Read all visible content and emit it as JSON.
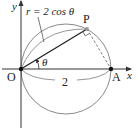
{
  "diagram": {
    "type": "polar-circle",
    "labels": {
      "y_axis": "y",
      "x_axis": "x",
      "origin": "O",
      "point_a": "A",
      "point_p": "P",
      "angle": "θ",
      "diameter": "2",
      "equation": "r = 2 cos θ"
    },
    "colors": {
      "axis": "#333333",
      "circle": "#8a8a8a",
      "chord": "#222222",
      "point": "#111111",
      "point_p": "#999999"
    }
  }
}
